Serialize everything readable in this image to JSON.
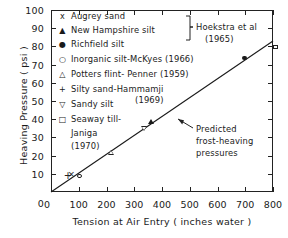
{
  "chart_data": {
    "type": "scatter",
    "title": "",
    "xlabel": "Tension at Air Entry ( inches  water )",
    "ylabel": "Heaving  Pressure ( psi )",
    "xlim": [
      0,
      800
    ],
    "ylim": [
      0,
      100
    ],
    "xticks": [
      0,
      100,
      200,
      300,
      400,
      500,
      600,
      700,
      800
    ],
    "yticks": [
      0,
      10,
      20,
      30,
      40,
      50,
      60,
      70,
      80,
      90,
      100
    ],
    "grid": false,
    "legend_position": "upper-left-inside",
    "series": [
      {
        "name": "Augrey sand",
        "marker": "x",
        "points": [
          [
            72,
            9
          ]
        ]
      },
      {
        "name": "New Hampshire silt",
        "marker": "triangle-up-filled",
        "points": [
          [
            350,
            40
          ]
        ]
      },
      {
        "name": "Richfield silt",
        "marker": "circle-filled",
        "points": [
          [
            690,
            75
          ]
        ]
      },
      {
        "name": "Inorganic silt-McKyes",
        "marker": "circle-open",
        "points": [
          [
            95,
            10
          ]
        ]
      },
      {
        "name": "Potters flint-Penner",
        "marker": "triangle-up-open",
        "points": [
          [
            205,
            23
          ]
        ]
      },
      {
        "name": "Silty sand-Hammamji",
        "marker": "plus",
        "points": [
          [
            57,
            8
          ]
        ]
      },
      {
        "name": "Sandy silt",
        "marker": "triangle-down-open",
        "points": [
          [
            325,
            36
          ]
        ]
      },
      {
        "name": "Seaway till-Janiga",
        "marker": "square-open",
        "points": [
          [
            800,
            81
          ]
        ]
      }
    ],
    "fit_line": {
      "name": "Predicted frost-heaving pressures",
      "x": [
        0,
        800
      ],
      "y": [
        0,
        83
      ]
    },
    "annotations": [
      {
        "text_lines": [
          "Predicted",
          "frost-heaving",
          "pressures"
        ],
        "points_to": [
          405,
          45
        ]
      }
    ]
  },
  "legend": {
    "entries": [
      {
        "symbol": "x",
        "label": "Augrey  sand"
      },
      {
        "symbol": "▲",
        "label": "New Hampshire  silt"
      },
      {
        "symbol": "●",
        "label": "Richfield  silt"
      },
      {
        "symbol": "○",
        "label": "Inorganic silt-McKyes  (1966)"
      },
      {
        "symbol": "△",
        "label": "Potters  flint- Penner (1959)"
      },
      {
        "symbol": "+",
        "label": "Silty sand-Hammamji"
      },
      {
        "symbol": "▽",
        "label": "Sandy  silt"
      },
      {
        "symbol": "□",
        "label": "Seaway  till-"
      }
    ],
    "group_bracket": {
      "label_line1": "Hoekstra et al",
      "label_line2": "(1965)"
    },
    "extra_year_hammamji": "(1969)",
    "janiga_line1": "Janiga",
    "janiga_line2": "(1970)"
  },
  "annotation": {
    "line1": "Predicted",
    "line2": "frost-heaving",
    "line3": "pressures"
  },
  "axes": {
    "x_title": "Tension at Air Entry ( inches  water )",
    "y_title": "Heaving  Pressure ( psi )",
    "x_tick_labels": [
      "0",
      "100",
      "200",
      "300",
      "400",
      "500",
      "600",
      "700",
      "800"
    ],
    "y_tick_labels": [
      "0",
      "10",
      "20",
      "30",
      "40",
      "50",
      "60",
      "70",
      "80",
      "90",
      "100"
    ]
  }
}
